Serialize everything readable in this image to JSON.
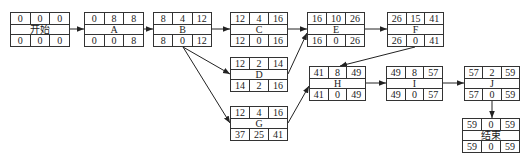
{
  "nodes": {
    "start": {
      "label": "开始",
      "es": "0",
      "dur": "0",
      "ef": "0",
      "ls": "0",
      "tf": "0",
      "lf": "0"
    },
    "A": {
      "label": "A",
      "es": "0",
      "dur": "8",
      "ef": "8",
      "ls": "0",
      "tf": "0",
      "lf": "8"
    },
    "B": {
      "label": "B",
      "es": "8",
      "dur": "4",
      "ef": "12",
      "ls": "8",
      "tf": "0",
      "lf": "12"
    },
    "C": {
      "label": "C",
      "es": "12",
      "dur": "4",
      "ef": "16",
      "ls": "12",
      "tf": "0",
      "lf": "16"
    },
    "D": {
      "label": "D",
      "es": "12",
      "dur": "2",
      "ef": "14",
      "ls": "14",
      "tf": "2",
      "lf": "16"
    },
    "G": {
      "label": "G",
      "es": "12",
      "dur": "4",
      "ef": "16",
      "ls": "37",
      "tf": "25",
      "lf": "41"
    },
    "E": {
      "label": "E",
      "es": "16",
      "dur": "10",
      "ef": "26",
      "ls": "16",
      "tf": "0",
      "lf": "26"
    },
    "F": {
      "label": "F",
      "es": "26",
      "dur": "15",
      "ef": "41",
      "ls": "26",
      "tf": "0",
      "lf": "41"
    },
    "H": {
      "label": "H",
      "es": "41",
      "dur": "8",
      "ef": "49",
      "ls": "41",
      "tf": "0",
      "lf": "49"
    },
    "I": {
      "label": "I",
      "es": "49",
      "dur": "8",
      "ef": "57",
      "ls": "49",
      "tf": "0",
      "lf": "57"
    },
    "J": {
      "label": "J",
      "es": "57",
      "dur": "2",
      "ef": "59",
      "ls": "57",
      "tf": "0",
      "lf": "59"
    },
    "end": {
      "label": "结束",
      "es": "59",
      "dur": "0",
      "ef": "59",
      "ls": "59",
      "tf": "0",
      "lf": "59"
    }
  },
  "edges": [
    [
      "start",
      "A"
    ],
    [
      "A",
      "B"
    ],
    [
      "B",
      "C"
    ],
    [
      "B",
      "D"
    ],
    [
      "B",
      "G"
    ],
    [
      "C",
      "E"
    ],
    [
      "D",
      "E"
    ],
    [
      "E",
      "F"
    ],
    [
      "F",
      "H"
    ],
    [
      "G",
      "H"
    ],
    [
      "H",
      "I"
    ],
    [
      "I",
      "J"
    ],
    [
      "J",
      "end"
    ]
  ]
}
